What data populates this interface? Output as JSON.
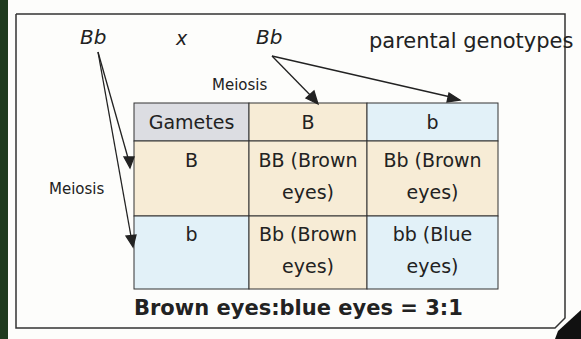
{
  "cross": {
    "parent1": "Bb",
    "cross_symbol": "x",
    "parent2": "Bb",
    "caption": "parental genotypes"
  },
  "labels": {
    "meiosis_top": "Meiosis",
    "meiosis_left": "Meiosis"
  },
  "punnett": {
    "corner": "Gametes",
    "columns": [
      "B",
      "b"
    ],
    "rows": [
      {
        "header": "B",
        "cells": [
          [
            "BB (Brown",
            "eyes)"
          ],
          [
            "Bb (Brown",
            "eyes)"
          ]
        ]
      },
      {
        "header": "b",
        "cells": [
          [
            "Bb (Brown",
            "eyes)"
          ],
          [
            "bb (Blue",
            "eyes)"
          ]
        ]
      }
    ]
  },
  "result": "Brown eyes:blue eyes = 3:1",
  "colors": {
    "tan": "#f7ecd6",
    "blue": "#e2f1f8",
    "grey": "#dcdde2",
    "border": "#333333",
    "strip": "#1f3a1e"
  }
}
